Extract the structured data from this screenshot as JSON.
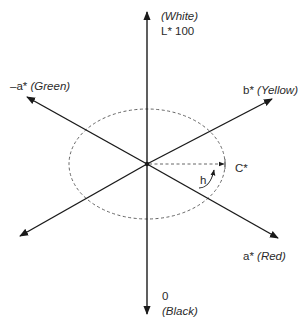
{
  "diagram": {
    "axes": {
      "lightness": {
        "label": "L* 100",
        "top_note": "(White)",
        "bottom_value": "0",
        "bottom_note": "(Black)"
      },
      "a_positive": {
        "symbol": "a*",
        "note": "(Red)"
      },
      "a_negative": {
        "symbol": "–a*",
        "note": "(Green)"
      },
      "b_positive": {
        "symbol": "b*",
        "note": "(Yellow)"
      }
    },
    "chroma_label": "C*",
    "hue_label": "h",
    "colors": {
      "stroke": "#1a1a1a",
      "dashed": "#555555",
      "text": "#2a2a2a"
    }
  }
}
